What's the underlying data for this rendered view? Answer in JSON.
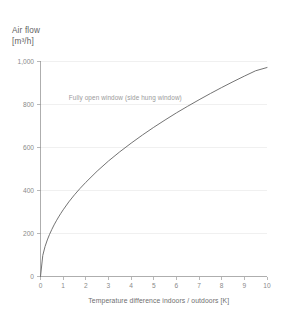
{
  "chart_data": {
    "type": "line",
    "title": "Air flow",
    "ylabel": "Air flow",
    "yunit": "[m³/h]",
    "xlabel": "Temperature difference indoors / outdoors [K]",
    "xlim": [
      0,
      10
    ],
    "ylim": [
      0,
      1000
    ],
    "grid": true,
    "legend_position": "none",
    "xticks": [
      0,
      1,
      2,
      3,
      4,
      5,
      6,
      7,
      8,
      9,
      10
    ],
    "xticklabels": [
      "0",
      "1",
      "2",
      "3",
      "4",
      "5",
      "6",
      "7",
      "8",
      "9",
      "10"
    ],
    "yticks": [
      0,
      200,
      400,
      600,
      800,
      1000
    ],
    "yticklabels": [
      "0",
      "200",
      "400",
      "600",
      "800",
      "1,000"
    ],
    "annotations": [
      {
        "text": "Fully open window (side hung window)",
        "x": 1.25,
        "y": 820
      }
    ],
    "series": [
      {
        "name": "Fully open window (side hung window)",
        "color": "#6b6b6b",
        "x": [
          0,
          0.1,
          0.2,
          0.3,
          0.4,
          0.5,
          0.6,
          0.7,
          0.8,
          0.9,
          1,
          1.25,
          1.5,
          1.75,
          2,
          2.5,
          3,
          3.5,
          4,
          4.5,
          5,
          5.5,
          6,
          6.5,
          7,
          7.5,
          8,
          8.5,
          9,
          9.5,
          10
        ],
        "y": [
          0,
          98,
          139,
          170,
          196,
          219,
          240,
          259,
          277,
          294,
          310,
          347,
          380,
          410,
          438,
          490,
          537,
          580,
          620,
          658,
          694,
          728,
          761,
          792,
          822,
          851,
          879,
          906,
          932,
          957,
          972
        ]
      }
    ]
  }
}
